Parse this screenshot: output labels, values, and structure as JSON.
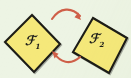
{
  "figure": {
    "kind": "mathematical-diagram",
    "background_color": "#edf4e4",
    "shape_fill_color": "#f5e87a",
    "shape_stroke_color": "#1c1c18",
    "arrow_color": "#cf5f48",
    "label_color": "#20201c"
  },
  "shapes": [
    {
      "id": "shape-1",
      "label_base": "ℱ",
      "label_sub": "1",
      "label_full": "ℱ1",
      "fill": "#f5e87a",
      "stroke": "#1c1c18",
      "points": "32,15 60,44 34,72 5,42"
    },
    {
      "id": "shape-2",
      "label_base": "ℱ",
      "label_sub": "2",
      "label_full": "ℱ2",
      "fill": "#f5e87a",
      "stroke": "#1c1c18",
      "points": "93,18 127,38 109,73 73,52"
    }
  ],
  "arrows": [
    {
      "id": "arrow-forward",
      "direction": "left-to-right",
      "from_shape": "shape-1",
      "to_shape": "shape-2",
      "color": "#cf5f48",
      "path": "M 52,19 C 60,7 72,7 80,16",
      "head_at": "80,18",
      "head_angle": 52
    },
    {
      "id": "arrow-backward",
      "direction": "right-to-left",
      "from_shape": "shape-2",
      "to_shape": "shape-1",
      "color": "#cf5f48",
      "path": "M 80,57 C 70,66 60,62 54,53",
      "head_at": "53,52",
      "head_angle": 232
    }
  ]
}
